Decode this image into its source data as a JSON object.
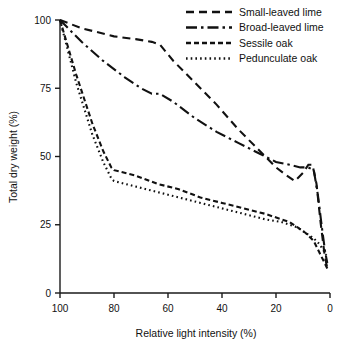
{
  "chart_data": {
    "type": "line",
    "title": "",
    "xlabel": "Relative light intensity (%)",
    "ylabel": "Total dry weight (%)",
    "xlim": [
      100,
      0
    ],
    "ylim": [
      0,
      100
    ],
    "x_ticks": [
      100,
      80,
      60,
      40,
      20,
      0
    ],
    "y_ticks": [
      0,
      25,
      50,
      75,
      100
    ],
    "x_tick_labels": [
      "100",
      "80",
      "60",
      "40",
      "20",
      "0"
    ],
    "y_tick_labels": [
      "0",
      "25",
      "50",
      "75",
      "100"
    ],
    "x_axis_reversed": true,
    "grid": false,
    "legend_position": "top-right",
    "series": [
      {
        "name": "Small-leaved lime",
        "dash": "8,5",
        "points": [
          [
            100,
            100
          ],
          [
            92,
            97
          ],
          [
            80,
            94
          ],
          [
            72,
            93
          ],
          [
            66,
            92
          ],
          [
            63,
            91
          ],
          [
            58,
            85
          ],
          [
            50,
            77
          ],
          [
            42,
            69
          ],
          [
            34,
            60
          ],
          [
            26,
            52
          ],
          [
            20,
            46
          ],
          [
            16,
            43
          ],
          [
            13,
            41
          ],
          [
            10,
            44
          ],
          [
            8,
            47
          ],
          [
            6.5,
            47
          ],
          [
            5,
            40
          ],
          [
            3.5,
            26
          ],
          [
            2,
            14
          ],
          [
            1,
            9
          ]
        ]
      },
      {
        "name": "Broad-leaved lime",
        "dash": "11,4,2.5,4",
        "points": [
          [
            100,
            100
          ],
          [
            92,
            92
          ],
          [
            84,
            85
          ],
          [
            76,
            79
          ],
          [
            70,
            75
          ],
          [
            66,
            73
          ],
          [
            63,
            73
          ],
          [
            58,
            70
          ],
          [
            50,
            64
          ],
          [
            42,
            59
          ],
          [
            34,
            55
          ],
          [
            26,
            51
          ],
          [
            20,
            48
          ],
          [
            15,
            47
          ],
          [
            11,
            46
          ],
          [
            8,
            46
          ],
          [
            6,
            45
          ],
          [
            4.5,
            36
          ],
          [
            3,
            24
          ],
          [
            1.8,
            15
          ],
          [
            1,
            11
          ]
        ]
      },
      {
        "name": "Sessile oak",
        "dash": "5,3",
        "points": [
          [
            100,
            100
          ],
          [
            94,
            80
          ],
          [
            88,
            62
          ],
          [
            84,
            52
          ],
          [
            81,
            46
          ],
          [
            80,
            45
          ],
          [
            72,
            43
          ],
          [
            64,
            40
          ],
          [
            56,
            38
          ],
          [
            48,
            35
          ],
          [
            40,
            33
          ],
          [
            32,
            31
          ],
          [
            24,
            29
          ],
          [
            18,
            27
          ],
          [
            15,
            26
          ],
          [
            12,
            24
          ],
          [
            9,
            22
          ],
          [
            6,
            19
          ],
          [
            4,
            15
          ],
          [
            2,
            11
          ],
          [
            1,
            9
          ]
        ]
      },
      {
        "name": "Pedunculate oak",
        "dash": "1.6,3.1",
        "points": [
          [
            100,
            100
          ],
          [
            94,
            77
          ],
          [
            88,
            58
          ],
          [
            84,
            48
          ],
          [
            81,
            42
          ],
          [
            80,
            41
          ],
          [
            72,
            39
          ],
          [
            64,
            37
          ],
          [
            56,
            35
          ],
          [
            48,
            33
          ],
          [
            40,
            31
          ],
          [
            32,
            29
          ],
          [
            24,
            27
          ],
          [
            18,
            26
          ],
          [
            15,
            25
          ],
          [
            12,
            24
          ],
          [
            9,
            22
          ],
          [
            6,
            20
          ],
          [
            4,
            18
          ],
          [
            2,
            15
          ],
          [
            1,
            13
          ]
        ]
      }
    ]
  },
  "legend": {
    "items": [
      {
        "label": "Small-leaved lime"
      },
      {
        "label": "Broad-leaved lime"
      },
      {
        "label": "Sessile oak"
      },
      {
        "label": "Pedunculate oak"
      }
    ]
  }
}
